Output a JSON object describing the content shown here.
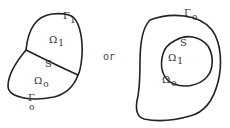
{
  "figure": {
    "left": {
      "region_top": {
        "symbol": "Ω",
        "subscript": "1"
      },
      "region_bottom": {
        "symbol": "Ω",
        "subscript": "o"
      },
      "interface": {
        "symbol": "S"
      },
      "boundary_top": {
        "symbol": "Γ",
        "subscript": "1"
      },
      "boundary_bottom": {
        "symbol": "Γ",
        "subscript": "o"
      }
    },
    "connector": "or",
    "right": {
      "inner_region": {
        "symbol": "Ω",
        "subscript": "1"
      },
      "outer_region": {
        "symbol": "Ω",
        "subscript": "o"
      },
      "interface": {
        "symbol": "S"
      },
      "outer_boundary": {
        "symbol": "Γ",
        "subscript": "o"
      }
    }
  }
}
